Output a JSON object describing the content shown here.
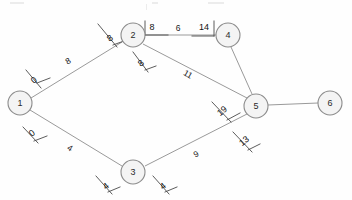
{
  "diagram": {
    "nodes": [
      {
        "id": "1",
        "label": "1",
        "x": 20,
        "y": 103
      },
      {
        "id": "2",
        "label": "2",
        "x": 133,
        "y": 35
      },
      {
        "id": "3",
        "label": "3",
        "x": 133,
        "y": 172
      },
      {
        "id": "4",
        "label": "4",
        "x": 228,
        "y": 35
      },
      {
        "id": "5",
        "label": "5",
        "x": 256,
        "y": 106
      },
      {
        "id": "6",
        "label": "6",
        "x": 330,
        "y": 103
      }
    ],
    "node_radius": 12,
    "edges": [
      {
        "from": "1",
        "to": "2",
        "weight": "8",
        "lx": 68,
        "ly": 61,
        "rot": -31
      },
      {
        "from": "1",
        "to": "3",
        "weight": "4",
        "lx": 70,
        "ly": 148,
        "rot": 31
      },
      {
        "from": "2",
        "to": "4",
        "weight": "6",
        "lx": 178,
        "ly": 28,
        "rot": 0
      },
      {
        "from": "2",
        "to": "5",
        "weight": "11",
        "lx": 188,
        "ly": 74,
        "rot": 30
      },
      {
        "from": "3",
        "to": "5",
        "weight": "9",
        "lx": 196,
        "ly": 154,
        "rot": -27
      },
      {
        "from": "4",
        "to": "5",
        "weight": "",
        "lx": 0,
        "ly": 0,
        "rot": 0
      },
      {
        "from": "5",
        "to": "6",
        "weight": "",
        "lx": 0,
        "ly": 0,
        "rot": 0
      }
    ],
    "annotations": [
      {
        "name": "node-1-upper-distance",
        "value": "0",
        "x": 34,
        "y": 80,
        "rot": -38
      },
      {
        "name": "node-1-lower-distance",
        "value": "0",
        "x": 32,
        "y": 133,
        "rot": -38
      },
      {
        "name": "node-2-left-distance",
        "value": "8",
        "x": 110,
        "y": 38,
        "rot": -38
      },
      {
        "name": "node-2-top-distance",
        "value": "8",
        "x": 152,
        "y": 27,
        "rot": 0
      },
      {
        "name": "node-2-lower-distance",
        "value": "8",
        "x": 141,
        "y": 63,
        "rot": -38
      },
      {
        "name": "node-4-left-distance",
        "value": "14",
        "x": 204,
        "y": 27,
        "rot": 0
      },
      {
        "name": "node-5-upper-distance",
        "value": "19",
        "x": 222,
        "y": 111,
        "rot": -38
      },
      {
        "name": "node-5-lower-distance",
        "value": "13",
        "x": 244,
        "y": 141,
        "rot": -38
      },
      {
        "name": "node-3-left-distance",
        "value": "4",
        "x": 106,
        "y": 186,
        "rot": -38
      },
      {
        "name": "node-3-right-distance",
        "value": "4",
        "x": 163,
        "y": 186,
        "rot": -38
      }
    ]
  }
}
